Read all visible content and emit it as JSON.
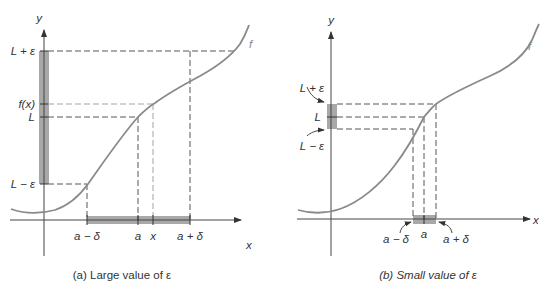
{
  "figure": {
    "panel_a": {
      "caption": "(a) Large value of ε",
      "y_axis_label": "y",
      "x_axis_label": "x",
      "curve_label": "f",
      "y_labels": {
        "L_plus_eps": "L + ε",
        "f_x": "f(x)",
        "L": "L",
        "L_minus_eps": "L − ε"
      },
      "x_labels": {
        "a_minus_delta": "a − δ",
        "a": "a",
        "x": "x",
        "a_plus_delta": "a + δ"
      }
    },
    "panel_b": {
      "caption": "(b) Small value of ε",
      "y_axis_label": "y",
      "x_axis_label": "x",
      "curve_label": "f",
      "y_labels": {
        "L_plus_eps": "L + ε",
        "L": "L",
        "L_minus_eps": "L − ε"
      },
      "x_labels": {
        "a_minus_delta": "a − δ",
        "a": "a",
        "a_plus_delta": "a + δ"
      }
    },
    "colors": {
      "curve": "#8a8a8a",
      "band": "#a8a8a8",
      "axis": "#444444"
    }
  }
}
